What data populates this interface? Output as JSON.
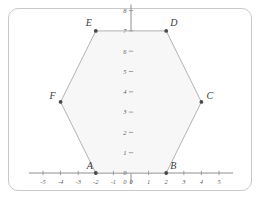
{
  "figure": {
    "background_color": "#ffffff",
    "frame_color": "#c9c9c9"
  },
  "chart_data": {
    "type": "scatter",
    "title": "",
    "xlabel": "",
    "ylabel": "",
    "xlim": [
      -5.8,
      5.8
    ],
    "ylim": [
      -0.55,
      8.3
    ],
    "grid": false,
    "legend": false,
    "axis_color": "#8e8e8e",
    "shape": {
      "name": "hexagon",
      "fill_color": "#f7f7f7",
      "edge_color": "#aaaaaa",
      "closed": true,
      "vertex_order": [
        "A",
        "B",
        "C",
        "D",
        "E",
        "F"
      ]
    },
    "points": [
      {
        "label": "A",
        "x": -2,
        "y": 0,
        "label_dx": -9,
        "label_dy": -4
      },
      {
        "label": "B",
        "x": 2,
        "y": 0,
        "label_dx": 4,
        "label_dy": -4
      },
      {
        "label": "C",
        "x": 4,
        "y": 3.5,
        "label_dx": 5,
        "label_dy": -3
      },
      {
        "label": "D",
        "x": 2,
        "y": 7,
        "label_dx": 4,
        "label_dy": -5
      },
      {
        "label": "E",
        "x": -2,
        "y": 7,
        "label_dx": -10,
        "label_dy": -5
      },
      {
        "label": "F",
        "x": -4,
        "y": 3.5,
        "label_dx": -11,
        "label_dy": -3
      }
    ],
    "x_ticks": [
      -5,
      -4,
      -3,
      -2,
      -1,
      0,
      1,
      2,
      3,
      4,
      5
    ],
    "x_tick_labels": [
      "-5",
      "-4",
      "-3",
      "-2",
      "-1",
      "0",
      "1",
      "2",
      "3",
      "4",
      "5"
    ],
    "y_ticks": [
      0,
      1,
      2,
      3,
      4,
      5,
      6,
      7,
      8
    ],
    "y_tick_labels": [
      "0",
      "1",
      "2",
      "3",
      "4",
      "5",
      "6",
      "7",
      "8"
    ]
  }
}
